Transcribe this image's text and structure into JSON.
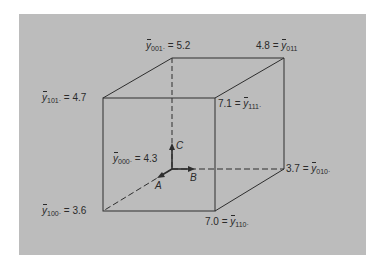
{
  "diagram": {
    "type": "cube-factorial-design",
    "axes": {
      "A": "A",
      "B": "B",
      "C": "C"
    },
    "corners": [
      {
        "id": "000",
        "sym": "y",
        "sub": "000·",
        "eq": "=",
        "value": "4.3"
      },
      {
        "id": "100",
        "sym": "y",
        "sub": "100·",
        "eq": "=",
        "value": "3.6"
      },
      {
        "id": "010",
        "sym": "y",
        "sub": "010·",
        "eq": "=",
        "value": "3.7"
      },
      {
        "id": "110",
        "sym": "y",
        "sub": "110·",
        "eq": "=",
        "value": "7.0"
      },
      {
        "id": "001",
        "sym": "y",
        "sub": "001·",
        "eq": "=",
        "value": "5.2"
      },
      {
        "id": "101",
        "sym": "y",
        "sub": "101·",
        "eq": "=",
        "value": "4.7"
      },
      {
        "id": "011",
        "sym": "y",
        "sub": "011",
        "eq": "=",
        "value": "4.8"
      },
      {
        "id": "111",
        "sym": "y",
        "sub": "111·",
        "eq": "=",
        "value": "7.1"
      }
    ],
    "colors": {
      "background": "#bcbcbc",
      "line": "#2e2e2e",
      "page": "#ffffff"
    }
  }
}
